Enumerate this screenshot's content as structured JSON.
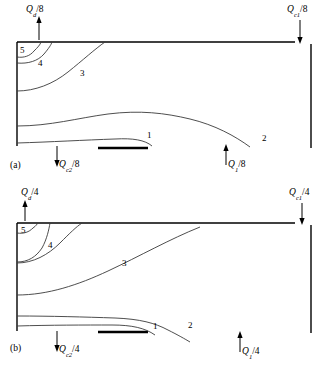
{
  "figure": {
    "type": "streamline-diagram",
    "panels": [
      {
        "tag": "(a)",
        "divisor": "8",
        "flows": [
          {
            "name": "Qd-top-left",
            "symbol": "Q",
            "sub": "d",
            "divisor": "8",
            "text": "Q_d/8",
            "direction": "up",
            "position": "top-left"
          },
          {
            "name": "Qc1-top-right",
            "symbol": "Q",
            "sub": "c1",
            "divisor": "8",
            "text": "Q_c1/8",
            "direction": "down",
            "position": "top-right"
          },
          {
            "name": "Qc2-bottom-left",
            "symbol": "Q",
            "sub": "c2",
            "divisor": "8",
            "text": "Q_c2/8",
            "direction": "down",
            "position": "bottom-left"
          },
          {
            "name": "Q1-bottom-right",
            "symbol": "Q",
            "sub": "1",
            "divisor": "8",
            "text": "Q_1/8",
            "direction": "up",
            "position": "bottom-right"
          }
        ],
        "streamline_labels": [
          "1",
          "2",
          "3",
          "4",
          "5"
        ]
      },
      {
        "tag": "(b)",
        "divisor": "4",
        "flows": [
          {
            "name": "Qd-top-left",
            "symbol": "Q",
            "sub": "d",
            "divisor": "4",
            "text": "Q_d/4",
            "direction": "up",
            "position": "top-left"
          },
          {
            "name": "Qc1-top-right",
            "symbol": "Q",
            "sub": "c1",
            "divisor": "4",
            "text": "Q_c1/4",
            "direction": "down",
            "position": "top-right"
          },
          {
            "name": "Qc2-bottom-left",
            "symbol": "Q",
            "sub": "c2",
            "divisor": "4",
            "text": "Q_c2/4",
            "direction": "down",
            "position": "bottom-left"
          },
          {
            "name": "Q1-bottom-right",
            "symbol": "Q",
            "sub": "1",
            "divisor": "4",
            "text": "Q_1/4",
            "direction": "up",
            "position": "bottom-right"
          }
        ],
        "streamline_labels": [
          "1",
          "2",
          "3",
          "4",
          "5"
        ]
      }
    ]
  },
  "panel_a": {
    "tag": "(a)",
    "q_top_left": "Q",
    "q_top_left_sub": "d",
    "q_top_left_div": "/8",
    "q_top_right": "Q",
    "q_top_right_sub": "c1",
    "q_top_right_div": "/8",
    "q_bottom_left": "Q",
    "q_bottom_left_sub": "c2",
    "q_bottom_left_div": "/8",
    "q_bottom_right": "Q",
    "q_bottom_right_sub": "1",
    "q_bottom_right_div": "/8",
    "s1": "1",
    "s2": "2",
    "s3": "3",
    "s4": "4",
    "s5": "5"
  },
  "panel_b": {
    "tag": "(b)",
    "q_top_left": "Q",
    "q_top_left_sub": "d",
    "q_top_left_div": "/4",
    "q_top_right": "Q",
    "q_top_right_sub": "c1",
    "q_top_right_div": "/4",
    "q_bottom_left": "Q",
    "q_bottom_left_sub": "c2",
    "q_bottom_left_div": "/4",
    "q_bottom_right": "Q",
    "q_bottom_right_sub": "1",
    "q_bottom_right_div": "/4",
    "s1": "1",
    "s2": "2",
    "s3": "3",
    "s4": "4",
    "s5": "5"
  },
  "colors": {
    "line": "#000000",
    "streamline": "#3a3a3a",
    "background": "#ffffff"
  }
}
